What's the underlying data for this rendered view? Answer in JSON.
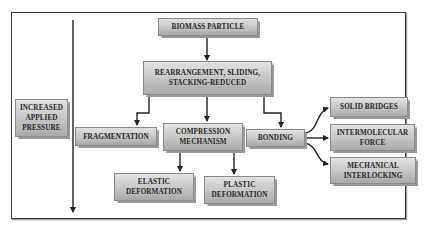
{
  "diagram": {
    "side_label": "INCREASED APPLIED PRESSURE",
    "nodes": {
      "biomass": "BIOMASS PARTICLE",
      "rearrangement_line1": "REARRANGEMENT, SLIDING,",
      "rearrangement_line2": "STACKING-REDUCED",
      "fragmentation": "FRAGMENTATION",
      "compression_line1": "COMPRESSION",
      "compression_line2": "MECHANISM",
      "bonding": "BONDING",
      "solid_bridges": "SOLID BRIDGES",
      "intermolecular_line1": "INTERMOLECULAR",
      "intermolecular_line2": "FORCE",
      "mechanical_line1": "MECHANICAL",
      "mechanical_line2": "INTERLOCKING",
      "elastic_line1": "ELASTIC",
      "elastic_line2": "DEFORMATION",
      "plastic_line1": "PLASTIC",
      "plastic_line2": "DEFORMATION"
    },
    "side_label_lines": [
      "INCREASED",
      "APPLIED",
      "PRESSURE"
    ],
    "colors": {
      "box_top": "#e2e2e2",
      "box_bottom": "#a9a9a9",
      "line": "#222222",
      "frame": "#3a3a3a"
    }
  }
}
